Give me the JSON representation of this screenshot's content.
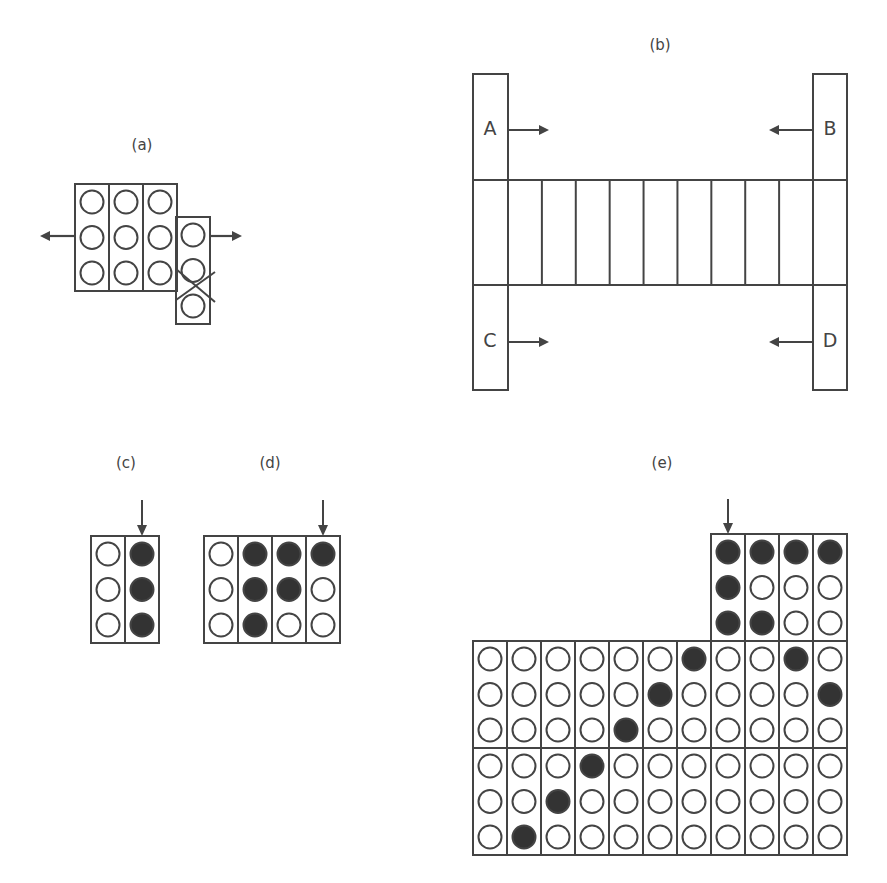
{
  "panels": {
    "a": {
      "label": "(a)",
      "columns": [
        [
          0,
          0,
          0
        ],
        [
          0,
          0,
          0
        ],
        [
          0,
          0,
          0
        ]
      ],
      "offset_column": [
        0,
        0,
        0
      ],
      "arrows": [
        "left",
        "right"
      ],
      "crossed_between": [
        2,
        3
      ]
    },
    "b": {
      "label": "(b)",
      "bars": [
        {
          "name": "A",
          "arrow": "right"
        },
        {
          "name": "B",
          "arrow": "left"
        },
        {
          "name": "C",
          "arrow": "right"
        },
        {
          "name": "D",
          "arrow": "left"
        }
      ],
      "band_columns": 9
    },
    "c": {
      "label": "(c)",
      "columns": [
        [
          0,
          0,
          0
        ],
        [
          1,
          1,
          1
        ]
      ],
      "arrow_column": 2
    },
    "d": {
      "label": "(d)",
      "columns": [
        [
          0,
          0,
          0
        ],
        [
          1,
          1,
          1
        ],
        [
          1,
          1,
          0
        ],
        [
          1,
          0,
          0
        ]
      ],
      "arrow_column": 4
    },
    "e": {
      "label": "(e)",
      "top_block_start_column": 8,
      "top_block": [
        [
          1,
          1,
          1
        ],
        [
          1,
          0,
          1
        ],
        [
          1,
          0,
          0
        ],
        [
          1,
          0,
          0
        ]
      ],
      "arrow_column": 1,
      "row1": [
        [
          0,
          0,
          0
        ],
        [
          0,
          0,
          0
        ],
        [
          0,
          0,
          0
        ],
        [
          0,
          0,
          0
        ],
        [
          0,
          0,
          1
        ],
        [
          0,
          1,
          0
        ],
        [
          1,
          0,
          0
        ],
        [
          0,
          0,
          0
        ],
        [
          0,
          0,
          0
        ],
        [
          1,
          0,
          0
        ],
        [
          0,
          1,
          0
        ]
      ],
      "row2": [
        [
          0,
          0,
          0
        ],
        [
          0,
          0,
          1
        ],
        [
          0,
          1,
          0
        ],
        [
          1,
          0,
          0
        ],
        [
          0,
          0,
          0
        ],
        [
          0,
          0,
          0
        ],
        [
          0,
          0,
          0
        ],
        [
          0,
          0,
          0
        ],
        [
          0,
          0,
          0
        ],
        [
          0,
          0,
          0
        ],
        [
          0,
          0,
          0
        ]
      ]
    }
  },
  "colors": {
    "stroke": "#444444",
    "fill": "#333333"
  }
}
